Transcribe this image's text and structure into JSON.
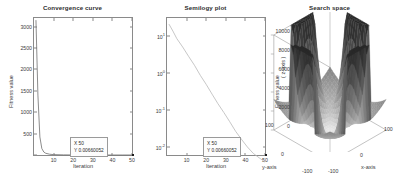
{
  "figure": {
    "background": "#ffffff",
    "panel_count": 3
  },
  "chart_data": [
    {
      "type": "line",
      "id": "convergence",
      "title": "Convergence curve",
      "xlabel": "Iteration",
      "ylabel": "Fitness value",
      "xlim": [
        0,
        50
      ],
      "ylim": [
        0,
        3200
      ],
      "xticks": [
        10,
        20,
        30,
        40,
        50
      ],
      "yticks": [
        500,
        1000,
        1500,
        2000,
        2500,
        3000
      ],
      "grid": false,
      "yscale": "linear",
      "series": [
        {
          "name": "best fitness",
          "color": "#6f6f6f",
          "x": [
            1,
            2,
            3,
            4,
            5,
            6,
            8,
            10,
            15,
            20,
            25,
            30,
            35,
            40,
            45,
            50
          ],
          "values": [
            3150,
            1400,
            420,
            150,
            70,
            40,
            18,
            9,
            3,
            1.2,
            0.6,
            0.25,
            0.1,
            0.04,
            0.015,
            0.00660052
          ]
        }
      ],
      "datatip": {
        "x_row": "X 50",
        "y_row": "Y 0.00660052"
      }
    },
    {
      "type": "line",
      "id": "semilogy",
      "title": "Semilogy plot",
      "xlabel": "Iteration",
      "ylabel": "Fitness value",
      "xlim": [
        0,
        50
      ],
      "ylim": [
        0.01,
        30
      ],
      "xticks": [
        10,
        20,
        30,
        40,
        50
      ],
      "yticks": [
        "10",
        "10",
        "10",
        "10"
      ],
      "ytick_exponents": [
        "1",
        "0",
        "-1",
        "-2"
      ],
      "grid": false,
      "yscale": "log",
      "series": [
        {
          "name": "best fitness (log)",
          "color": "#b9b9b9",
          "x": [
            1,
            3,
            5,
            8,
            11,
            14,
            17,
            20,
            23,
            26,
            29,
            32,
            35,
            38,
            41,
            44,
            47,
            50
          ],
          "values": [
            21,
            14,
            9,
            5.5,
            3.2,
            1.9,
            1.05,
            0.62,
            0.35,
            0.2,
            0.12,
            0.07,
            0.04,
            0.025,
            0.016,
            0.011,
            0.0085,
            0.00660052
          ]
        }
      ],
      "datatip": {
        "x_row": "X 50",
        "y_row": "Y 0.00660052"
      }
    },
    {
      "type": "surface",
      "id": "search-space",
      "title": "Search space",
      "xlabel": "x-axis",
      "ylabel": "y-axis",
      "zlabel": "( z-axis )",
      "xlim": [
        -100,
        100
      ],
      "ylim": [
        -100,
        100
      ],
      "zlim": [
        0,
        10000
      ],
      "zticks": [
        0,
        2000,
        4000,
        6000,
        8000,
        10000
      ],
      "xticks": [
        -100,
        0,
        100
      ],
      "yticks": [
        -100,
        0,
        100
      ],
      "colormap": "gray",
      "description": "Benchmark function surface with four sharp high ridges rising to 10000 and a smooth basin at the centre",
      "peak_value": 10000,
      "floor_value": 0
    }
  ]
}
